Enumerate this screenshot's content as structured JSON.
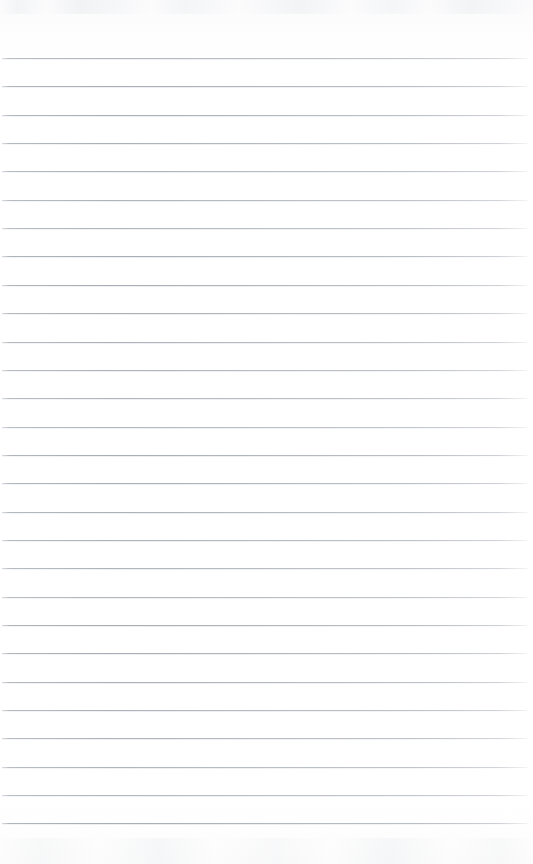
{
  "document": {
    "type": "lined-notebook-page",
    "title": "Blank Lined Notebook Page",
    "content_text": "",
    "page_width": 533,
    "page_height": 864,
    "paper_color": "#fefefe",
    "rule_color": "#acb1b8",
    "has_margin_rule": false,
    "has_header": false,
    "has_page_number": false,
    "written_content": []
  },
  "ruling": {
    "line_count": 28,
    "first_line_y": 58,
    "line_spacing": 28.35,
    "line_thickness": 1,
    "line_left_x": 2,
    "line_right_x": 530,
    "orientation": "horizontal",
    "style": "single-ruled"
  },
  "artifacts": {
    "top_scan_noise": "faint gray scanner smudge band",
    "bottom_scan_noise": "faint gray scanner smudge band",
    "edge_vignette": "subtle"
  }
}
